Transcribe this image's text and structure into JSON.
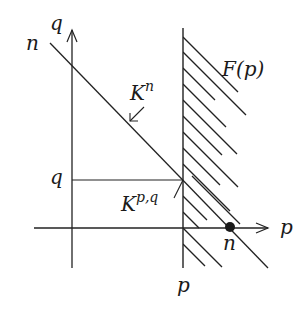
{
  "diagram": {
    "colors": {
      "ink": "#222222",
      "background": "#ffffff"
    },
    "axes": {
      "horizontal": {
        "label": "p",
        "arrow": true
      },
      "vertical": {
        "label": "q",
        "arrow": true
      }
    },
    "labels": {
      "diagonal_start": "n",
      "q_axis": "q",
      "p_axis": "p",
      "region": "F(p)",
      "region_base": "F",
      "region_arg": "(p)",
      "diagonal_name_base": "K",
      "diagonal_name_sup": "n",
      "point_name_base": "K",
      "point_name_sup": "p,q",
      "q_tick": "q",
      "p_tick": "p",
      "intercept": "n"
    },
    "elements": [
      {
        "type": "axis",
        "name": "p-axis"
      },
      {
        "type": "axis",
        "name": "q-axis"
      },
      {
        "type": "line",
        "name": "vertical-line-p",
        "label": "p"
      },
      {
        "type": "hatched-region",
        "name": "F(p)",
        "side": "right of p"
      },
      {
        "type": "line",
        "name": "diagonal-n",
        "label": "K^n"
      },
      {
        "type": "segment",
        "name": "horizontal-q",
        "label": "q"
      },
      {
        "type": "point",
        "name": "K^{p,q}",
        "at": "intersection of q-line and p-line"
      },
      {
        "type": "point",
        "name": "n-intercept",
        "at": "diagonal meets p-axis",
        "style": "filled dot"
      }
    ]
  }
}
